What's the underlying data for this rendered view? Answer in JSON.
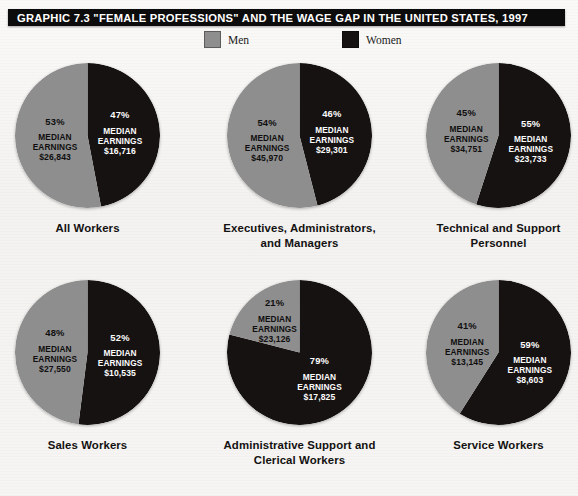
{
  "header": {
    "title": "GRAPHIC 7.3   \"FEMALE PROFESSIONS\" AND THE WAGE GAP IN THE UNITED STATES, 1997"
  },
  "legend": {
    "men_label": "Men",
    "women_label": "Women",
    "men_color": "#8e8e8e",
    "women_color": "#161212"
  },
  "labels": {
    "median_line1": "MEDIAN",
    "median_line2": "EARNINGS"
  },
  "chart_data": {
    "type": "pie",
    "title": "\"FEMALE PROFESSIONS\" AND THE WAGE GAP IN THE UNITED STATES, 1997",
    "legend": [
      "Men",
      "Women"
    ],
    "legend_position": "top-center",
    "value_unit": "percent of workers in occupation",
    "annotation_unit": "median annual earnings (USD)",
    "charts": [
      {
        "title": "All Workers",
        "slices": [
          {
            "name": "Men",
            "percent": "53%",
            "value": 53,
            "median_earnings": "$26,843",
            "color": "#8e8e8e"
          },
          {
            "name": "Women",
            "percent": "47%",
            "value": 47,
            "median_earnings": "$16,716",
            "color": "#161212"
          }
        ]
      },
      {
        "title_line1": "Executives, Administrators,",
        "title_line2": "and Managers",
        "title": "Executives, Administrators, and Managers",
        "slices": [
          {
            "name": "Men",
            "percent": "54%",
            "value": 54,
            "median_earnings": "$45,970",
            "color": "#8e8e8e"
          },
          {
            "name": "Women",
            "percent": "46%",
            "value": 46,
            "median_earnings": "$29,301",
            "color": "#161212"
          }
        ]
      },
      {
        "title_line1": "Technical and Support",
        "title_line2": "Personnel",
        "title": "Technical and Support Personnel",
        "slices": [
          {
            "name": "Men",
            "percent": "45%",
            "value": 45,
            "median_earnings": "$34,751",
            "color": "#8e8e8e"
          },
          {
            "name": "Women",
            "percent": "55%",
            "value": 55,
            "median_earnings": "$23,733",
            "color": "#161212"
          }
        ]
      },
      {
        "title": "Sales Workers",
        "slices": [
          {
            "name": "Men",
            "percent": "48%",
            "value": 48,
            "median_earnings": "$27,550",
            "color": "#8e8e8e"
          },
          {
            "name": "Women",
            "percent": "52%",
            "value": 52,
            "median_earnings": "$10,535",
            "color": "#161212"
          }
        ]
      },
      {
        "title_line1": "Administrative Support and",
        "title_line2": "Clerical Workers",
        "title": "Administrative Support and Clerical Workers",
        "slices": [
          {
            "name": "Men",
            "percent": "21%",
            "value": 21,
            "median_earnings": "$23,126",
            "color": "#8e8e8e"
          },
          {
            "name": "Women",
            "percent": "79%",
            "value": 79,
            "median_earnings": "$17,825",
            "color": "#161212"
          }
        ]
      },
      {
        "title": "Service Workers",
        "slices": [
          {
            "name": "Men",
            "percent": "41%",
            "value": 41,
            "median_earnings": "$13,145",
            "color": "#8e8e8e"
          },
          {
            "name": "Women",
            "percent": "59%",
            "value": 59,
            "median_earnings": "$8,603",
            "color": "#161212"
          }
        ]
      }
    ]
  }
}
